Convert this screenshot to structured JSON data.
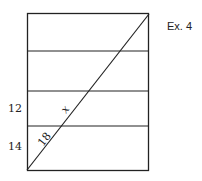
{
  "title": "Ex. 4",
  "diagram": {
    "left_labels": [
      "12",
      "14"
    ],
    "segment_labels": [
      "x",
      "18"
    ],
    "colors": {
      "stroke": "#222222",
      "background": "#ffffff"
    }
  }
}
